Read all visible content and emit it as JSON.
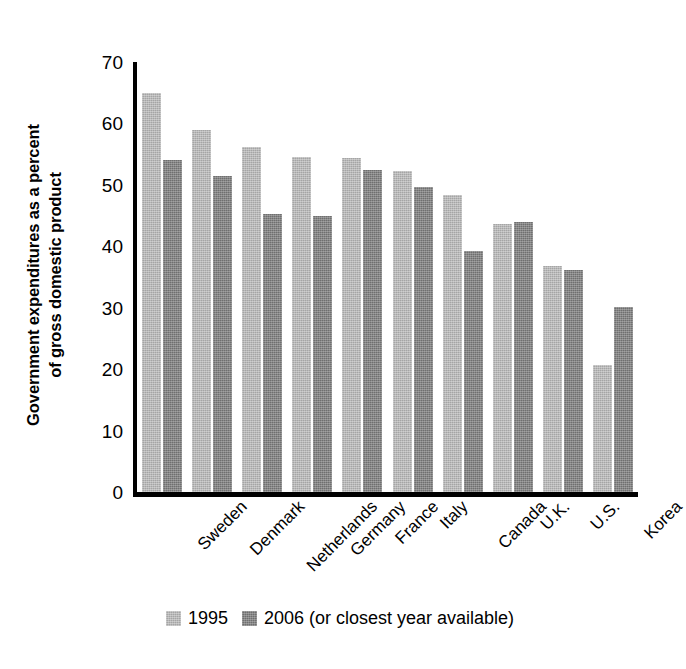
{
  "chart_data": {
    "type": "bar",
    "title": "",
    "subtitle": "",
    "xlabel": "",
    "ylabel_line1": "Government expenditures as a percent",
    "ylabel_line2": "of gross domestic product",
    "ylim": [
      0,
      70
    ],
    "yticks": [
      0,
      10,
      20,
      30,
      40,
      50,
      60,
      70
    ],
    "ytick_labels": [
      "0",
      "10",
      "20",
      "30",
      "40",
      "50",
      "60",
      "70"
    ],
    "grid": false,
    "legend_position": "bottom",
    "categories": [
      "Sweden",
      "Denmark",
      "Netherlands",
      "Germany",
      "France",
      "Italy",
      "Canada",
      "U.K.",
      "U.S.",
      "Korea"
    ],
    "series": [
      {
        "name": "1995",
        "color": "#a5a5a5",
        "values": [
          64.9,
          59.0,
          56.1,
          54.5,
          54.3,
          52.2,
          48.3,
          43.7,
          36.8,
          20.7
        ]
      },
      {
        "name": "2006 (or closest year available)",
        "color": "#6f6f6f",
        "values": [
          54.1,
          51.4,
          45.3,
          45.0,
          52.4,
          49.6,
          39.2,
          43.9,
          36.2,
          30.1
        ]
      }
    ]
  },
  "legend": {
    "items": [
      {
        "label": "1995",
        "color": "#a5a5a5"
      },
      {
        "label": "2006 (or closest year available)",
        "color": "#6f6f6f"
      }
    ]
  },
  "axis": {
    "line_color": "#000000"
  }
}
